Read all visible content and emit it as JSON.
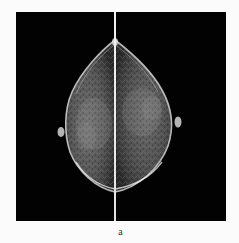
{
  "figure": {
    "caption": "a",
    "panel_background": "#020202",
    "page_background": "#fbfbfb",
    "divider_color": "#e8e8e8",
    "tissue_colors": {
      "outline": "#d9d9d9",
      "fibroglandular": "#8a8a8a",
      "fat": "#3a3a3a"
    },
    "views": [
      {
        "side": "left",
        "label": "left-breast-cc-view"
      },
      {
        "side": "right",
        "label": "right-breast-cc-view"
      }
    ]
  }
}
